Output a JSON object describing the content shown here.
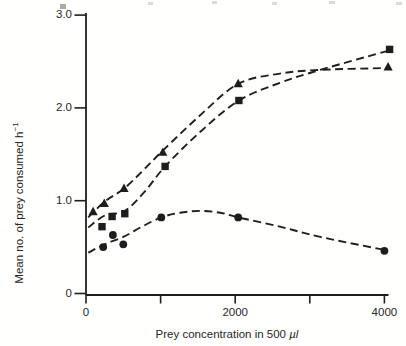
{
  "figure": {
    "background": "#fffffe",
    "ink_color": "#1f1f1f"
  },
  "chart_data": {
    "type": "line",
    "title": "",
    "xlabel": "Prey concentration in 500 µl",
    "xlabel_pre": "Prey concentration in 500 ",
    "xlabel_unit": "µl",
    "ylabel": "Mean no. of prey consumed h⁻¹",
    "ylabel_base": "Mean no. of prey consumed h",
    "ylabel_sup": "−1",
    "xlim": [
      0,
      4100
    ],
    "ylim": [
      0,
      3.0
    ],
    "grid": false,
    "legend": "none",
    "line_style": "dashed",
    "x_ticks": [
      {
        "value": 0,
        "label": "0"
      },
      {
        "value": 1000,
        "label": ""
      },
      {
        "value": 2000,
        "label": "2000"
      },
      {
        "value": 3000,
        "label": ""
      },
      {
        "value": 4000,
        "label": "4000"
      }
    ],
    "y_ticks": [
      {
        "value": 0,
        "label": "0"
      },
      {
        "value": 1,
        "label": "1.0"
      },
      {
        "value": 2,
        "label": "2.0"
      },
      {
        "value": 3,
        "label": "3.0"
      }
    ],
    "series": [
      {
        "name": "triangle-series",
        "marker": "triangle",
        "x": [
          95,
          245,
          510,
          1030,
          2040,
          4050
        ],
        "y": [
          0.88,
          0.97,
          1.13,
          1.52,
          2.26,
          2.44
        ],
        "curve_x": [
          30,
          250,
          510,
          770,
          1030,
          1530,
          2040,
          2600,
          3140,
          4050
        ],
        "curve_y": [
          0.82,
          0.99,
          1.13,
          1.33,
          1.54,
          1.92,
          2.26,
          2.37,
          2.41,
          2.43
        ]
      },
      {
        "name": "square-series",
        "marker": "square",
        "x": [
          215,
          350,
          520,
          1060,
          2050,
          4070
        ],
        "y": [
          0.72,
          0.83,
          0.86,
          1.37,
          2.08,
          2.63
        ],
        "curve_x": [
          30,
          250,
          520,
          790,
          1060,
          1530,
          2050,
          2600,
          3140,
          4070
        ],
        "curve_y": [
          0.71,
          0.84,
          0.89,
          1.1,
          1.37,
          1.74,
          2.08,
          2.27,
          2.41,
          2.62
        ]
      },
      {
        "name": "circle-series",
        "marker": "circle",
        "x": [
          230,
          360,
          500,
          1010,
          2040,
          4000
        ],
        "y": [
          0.5,
          0.63,
          0.53,
          0.82,
          0.82,
          0.46
        ],
        "curve_x": [
          30,
          250,
          500,
          750,
          1010,
          1260,
          1530,
          1800,
          2040,
          2600,
          3140,
          4000
        ],
        "curve_y": [
          0.44,
          0.53,
          0.61,
          0.72,
          0.82,
          0.87,
          0.89,
          0.87,
          0.82,
          0.72,
          0.61,
          0.47
        ]
      }
    ]
  }
}
